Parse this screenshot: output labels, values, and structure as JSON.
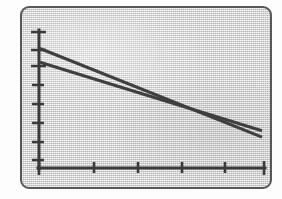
{
  "figure": {
    "frame_style": "rounded-rectangle",
    "background_color": "#d9d9d9",
    "border_color": "#585858",
    "ink_color": "#3f3f3f"
  },
  "chart_data": {
    "type": "line",
    "title": "",
    "subtitle": "",
    "xlabel": "",
    "ylabel": "",
    "grid": false,
    "legend": null,
    "legend_position": "none",
    "annotations": [],
    "xlim": [
      0,
      5
    ],
    "ylim": [
      0,
      7
    ],
    "xticks": [
      0,
      1,
      2,
      3,
      4,
      5
    ],
    "yticks": [
      0,
      1,
      2,
      3,
      4,
      5,
      6,
      7
    ],
    "xtick_labels": [
      "",
      "",
      "",
      "",
      "",
      ""
    ],
    "ytick_labels": [
      "",
      "",
      "",
      "",
      "",
      "",
      "",
      ""
    ],
    "series": [
      {
        "name": "Series 1",
        "x": [
          0,
          5
        ],
        "values": [
          6.1,
          1.25
        ],
        "color": "#3f3f3f"
      },
      {
        "name": "Series 2",
        "x": [
          0,
          5
        ],
        "values": [
          5.35,
          1.6
        ],
        "color": "#3f3f3f"
      }
    ],
    "intersection": {
      "x": 2.95,
      "y": 3.25
    }
  }
}
